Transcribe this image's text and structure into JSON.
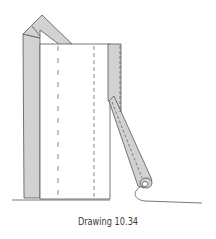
{
  "figure": {
    "caption": "Drawing 10.34",
    "colors": {
      "line": "#555555",
      "shade": "#d2d2d2",
      "paper": "#ffffff",
      "caption": "#3a3a3a"
    }
  }
}
